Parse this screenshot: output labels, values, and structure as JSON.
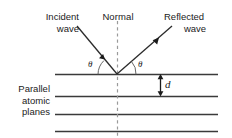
{
  "figure": {
    "title_incident_line1": "Incident",
    "title_incident_line2": "wave",
    "title_normal": "Normal",
    "title_reflected_line1": "Reflected",
    "title_reflected_line2": "wave",
    "planes_label_line1": "Parallel",
    "planes_label_line2": "atomic",
    "planes_label_line3": "planes",
    "angle_left": "θ",
    "angle_right": "θ",
    "spacing_label": "d",
    "colors": {
      "ink": "#1b1b1b",
      "plane_line": "#3a3a3a",
      "ray": "#2b2b2b",
      "normal_dashed": "#9a9a9a",
      "background": "#ffffff"
    },
    "geometry": {
      "planes_y": [
        74,
        96,
        114,
        131
      ],
      "plane_x_start": 55,
      "plane_x_end": 218,
      "vertex_x": 117,
      "vertex_y": 74,
      "normal_top_y": 21,
      "normal_bottom_y": 138,
      "incident_start": [
        77,
        26
      ],
      "reflected_end": [
        172,
        26
      ],
      "d_arrow_x": 160,
      "d_arrow_top": 74,
      "d_arrow_bottom": 96
    }
  }
}
